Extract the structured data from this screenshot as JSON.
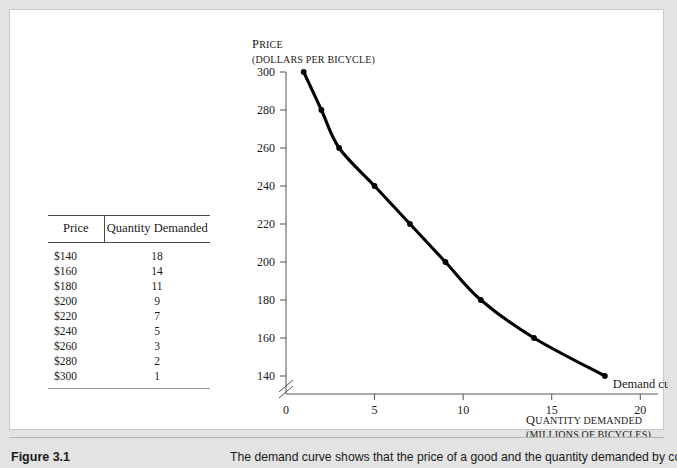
{
  "figure": {
    "number_label": "Figure 3.1",
    "caption": "The demand curve shows that the price of a good and the quantity demanded by con-"
  },
  "table": {
    "headers": {
      "price": "Price",
      "quantity": "Quantity Demanded"
    },
    "rows": [
      {
        "price": "$140",
        "quantity": "18"
      },
      {
        "price": "$160",
        "quantity": "14"
      },
      {
        "price": "$180",
        "quantity": "11"
      },
      {
        "price": "$200",
        "quantity": "9"
      },
      {
        "price": "$220",
        "quantity": "7"
      },
      {
        "price": "$240",
        "quantity": "5"
      },
      {
        "price": "$260",
        "quantity": "3"
      },
      {
        "price": "$280",
        "quantity": "2"
      },
      {
        "price": "$300",
        "quantity": "1"
      }
    ]
  },
  "chart_data": {
    "type": "line",
    "title": "",
    "xlabel": "QUANTITY DEMANDED",
    "xlabel_sub": "(MILLIONS OF BICYCLES)",
    "ylabel": "PRICE",
    "ylabel_sub": "(DOLLARS PER BICYCLE)",
    "x": [
      1,
      2,
      3,
      5,
      7,
      9,
      11,
      14,
      18
    ],
    "y": [
      300,
      280,
      260,
      240,
      220,
      200,
      180,
      160,
      140
    ],
    "series": [
      {
        "name": "Demand curve",
        "points": [
          {
            "quantity": 1,
            "price": 300
          },
          {
            "quantity": 2,
            "price": 280
          },
          {
            "quantity": 3,
            "price": 260
          },
          {
            "quantity": 5,
            "price": 240
          },
          {
            "quantity": 7,
            "price": 220
          },
          {
            "quantity": 9,
            "price": 200
          },
          {
            "quantity": 11,
            "price": 180
          },
          {
            "quantity": 14,
            "price": 160
          },
          {
            "quantity": 18,
            "price": 140
          }
        ]
      }
    ],
    "annotations": [
      {
        "text": "Demand curve",
        "quantity": 18,
        "price": 140
      }
    ],
    "xticks": [
      "0",
      "5",
      "10",
      "15",
      "20"
    ],
    "xtick_values": [
      0,
      5,
      10,
      15,
      20
    ],
    "yticks": [
      "140",
      "160",
      "180",
      "200",
      "220",
      "240",
      "260",
      "280",
      "300"
    ],
    "ytick_values": [
      140,
      160,
      180,
      200,
      220,
      240,
      260,
      280,
      300
    ],
    "xlim": [
      0,
      21
    ],
    "ylim": [
      140,
      300
    ],
    "y_axis_break": true,
    "origin_label": "0",
    "grid": false,
    "legend": "none",
    "line_color": "#000000",
    "marker_color": "#000000"
  }
}
